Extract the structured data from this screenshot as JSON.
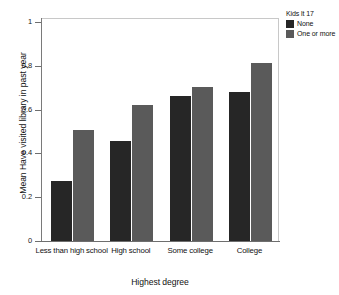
{
  "chart_data": {
    "type": "bar",
    "title": "",
    "xlabel": "Highest degree",
    "ylabel": "Mean Have visited library in past year",
    "categories": [
      "Less than high school",
      "High school",
      "Some college",
      "College"
    ],
    "series": [
      {
        "name": "None",
        "color": "#262626",
        "values": [
          0.275,
          0.455,
          0.66,
          0.68
        ]
      },
      {
        "name": "One or more",
        "color": "#5a5a5a",
        "values": [
          0.505,
          0.62,
          0.705,
          0.815
        ]
      }
    ],
    "ylim": [
      0,
      1
    ],
    "yticks": [
      0,
      0.2,
      0.4,
      0.6,
      0.8,
      1
    ],
    "ytick_labels": [
      "0",
      "0.2",
      "0.4",
      "0.6",
      "0.8",
      "1"
    ],
    "grid": false,
    "legend_position": "top-right",
    "legend_title": "Kids lt 17"
  },
  "axes": {
    "x_title": "Highest degree",
    "y_title": "Mean Have visited library in past year",
    "x_tick_labels": [
      "Less than high school",
      "High school",
      "Some college",
      "College"
    ],
    "y_tick_labels": [
      "1",
      "0.8",
      "0.6",
      "0.4",
      "0.2",
      "0"
    ]
  },
  "legend": {
    "title": "Kids lt 17",
    "items": [
      {
        "label": "None",
        "color": "#262626"
      },
      {
        "label": "One or more",
        "color": "#5a5a5a"
      }
    ]
  }
}
